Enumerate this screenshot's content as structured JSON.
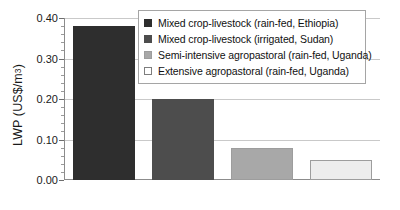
{
  "chart_data": {
    "type": "bar",
    "title": "",
    "xlabel": "",
    "ylabel": "LWP (US$/m3)",
    "ylabel_prefix": "LWP (US$/m",
    "ylabel_exponent": "3",
    "ylabel_suffix": ")",
    "ylim": [
      0.0,
      0.4
    ],
    "ytick_labels": [
      "0.00",
      "0.10",
      "0.20",
      "0.30",
      "0.40"
    ],
    "ytick_values": [
      0.0,
      0.1,
      0.2,
      0.3,
      0.4
    ],
    "minor_tick_step": 0.02,
    "grid": "horizontal",
    "legend_position": "top-right-inside",
    "categories": [
      "Mixed crop-livestock (rain-fed, Ethiopia)",
      "Mixed crop-livestock (irrigated, Sudan)",
      "Semi-intensive agropastoral (rain-fed, Uganda)",
      "Extensive agropastoral (rain-fed, Uganda)"
    ],
    "values": [
      0.38,
      0.2,
      0.08,
      0.05
    ],
    "bar_colors": [
      "#2e2e2e",
      "#4d4d4d",
      "#a8a8a8",
      "#ededed"
    ],
    "bar_border_colors": [
      "#2e2e2e",
      "#4d4d4d",
      "#9d9d9d",
      "#9d9d9d"
    ]
  },
  "legend": {
    "items": [
      {
        "label": "Mixed crop-livestock (rain-fed, Ethiopia)",
        "color": "#2e2e2e",
        "border": "#2e2e2e"
      },
      {
        "label": "Mixed crop-livestock (irrigated, Sudan)",
        "color": "#4d4d4d",
        "border": "#4d4d4d"
      },
      {
        "label": "Semi-intensive agropastoral (rain-fed, Uganda)",
        "color": "#a8a8a8",
        "border": "#9d9d9d"
      },
      {
        "label": "Extensive agropastoral (rain-fed, Uganda)",
        "color": "#ffffff",
        "border": "#7d7d7d"
      }
    ]
  },
  "colors": {
    "axis": "#8c8c8c",
    "gridline": "#c9c9c9",
    "text": "#1a1a1a",
    "background": "#ffffff"
  }
}
